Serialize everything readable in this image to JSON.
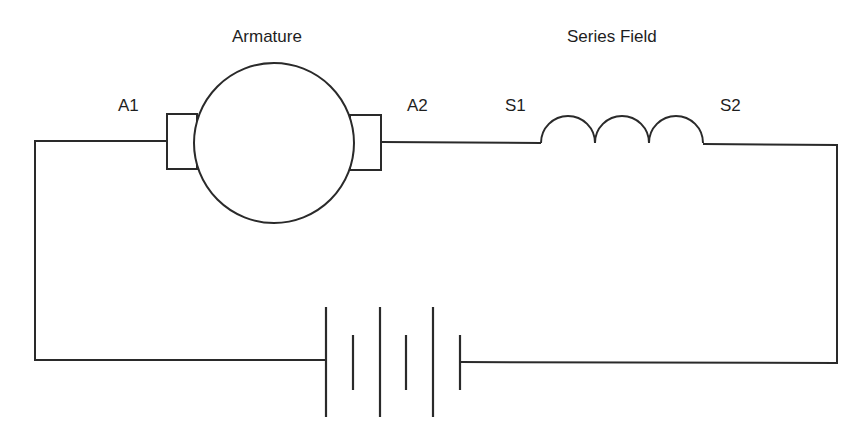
{
  "diagram": {
    "labels": {
      "armature": "Armature",
      "series_field": "Series Field",
      "a1": "A1",
      "a2": "A2",
      "s1": "S1",
      "s2": "S2"
    },
    "components": [
      {
        "id": "armature",
        "type": "motor-armature",
        "terminals": [
          "A1",
          "A2"
        ]
      },
      {
        "id": "series_field",
        "type": "inductor-coil",
        "turns": 3,
        "terminals": [
          "S1",
          "S2"
        ]
      },
      {
        "id": "battery",
        "type": "dc-source",
        "cells": 3
      }
    ],
    "colors": {
      "line": "#2a2a2a",
      "background": "#ffffff"
    }
  }
}
